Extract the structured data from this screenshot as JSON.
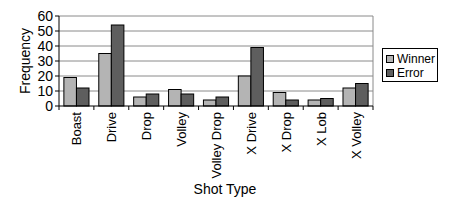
{
  "chart_data": {
    "type": "bar",
    "title": "",
    "xlabel": "Shot Type",
    "ylabel": "Frequency",
    "ylim": [
      0,
      60
    ],
    "yticks": [
      0,
      10,
      20,
      30,
      40,
      50,
      60
    ],
    "grid": true,
    "legend_position": "right",
    "categories": [
      "Boast",
      "Drive",
      "Drop",
      "Volley",
      "Volley Drop",
      "X Drive",
      "X Drop",
      "X Lob",
      "X Volley"
    ],
    "series": [
      {
        "name": "Winner",
        "color": "#b4b4b4",
        "values": [
          19,
          35,
          6,
          11,
          4,
          20,
          9,
          4,
          12
        ]
      },
      {
        "name": "Error",
        "color": "#5e5e5e",
        "values": [
          12,
          54,
          8,
          8,
          6,
          39,
          4,
          5,
          15
        ]
      }
    ]
  },
  "legend": {
    "items": [
      {
        "label": "Winner",
        "color": "#b4b4b4"
      },
      {
        "label": "Error",
        "color": "#5e5e5e"
      }
    ]
  }
}
